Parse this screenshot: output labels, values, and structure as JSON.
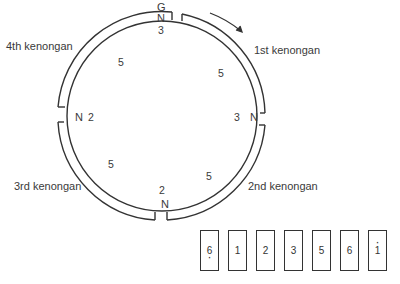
{
  "diagram": {
    "top_label": "G",
    "kenongan_labels": [
      {
        "label": "1st kenongan",
        "position": "upper-right"
      },
      {
        "label": "2nd kenongan",
        "position": "lower-right"
      },
      {
        "label": "3rd kenongan",
        "position": "lower-left"
      },
      {
        "label": "4th kenongan",
        "position": "upper-left"
      }
    ],
    "nong_marker": "N",
    "cycle_numbers": {
      "top": "3",
      "upper_right": "5",
      "right": "3",
      "lower_right": "5",
      "bottom": "2",
      "lower_left": "5",
      "left": "2",
      "upper_left": "5"
    },
    "direction_arrow": "clockwise",
    "colors": {
      "stroke": "#333333",
      "text": "#3a3a3a",
      "background": "#ffffff"
    }
  },
  "key": {
    "pitches": [
      {
        "label": "6",
        "dot": "below"
      },
      {
        "label": "1",
        "dot": "none"
      },
      {
        "label": "2",
        "dot": "none"
      },
      {
        "label": "3",
        "dot": "none"
      },
      {
        "label": "5",
        "dot": "none"
      },
      {
        "label": "6",
        "dot": "none"
      },
      {
        "label": "1",
        "dot": "above"
      }
    ]
  }
}
